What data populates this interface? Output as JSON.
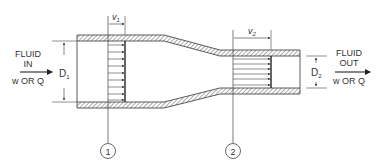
{
  "diagram": {
    "inlet": {
      "line1": "FLUID",
      "line2": "IN",
      "line3": "w OR Q",
      "diameter_label": "D",
      "diameter_sub": "1",
      "velocity_label": "v",
      "velocity_sub": "1"
    },
    "outlet": {
      "line1": "FLUID",
      "line2": "OUT",
      "line3": "w OR Q",
      "diameter_label": "D",
      "diameter_sub": "2",
      "velocity_label": "v",
      "velocity_sub": "2"
    },
    "sections": [
      {
        "id": "1",
        "label": "1"
      },
      {
        "id": "2",
        "label": "2"
      }
    ],
    "colors": {
      "line": "#333333",
      "hatch": "#555555",
      "background": "#ffffff"
    }
  }
}
